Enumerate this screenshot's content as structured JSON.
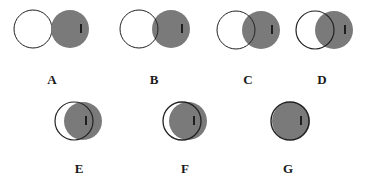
{
  "figure": {
    "panels": [
      {
        "label": "A",
        "white": {
          "cx": 33,
          "cy": 29,
          "r": 19
        },
        "gray": {
          "cx": 70,
          "cy": 29,
          "r": 19
        },
        "mark": {
          "x": 81,
          "y": 29
        },
        "label_pos": {
          "x": 52,
          "y": 84
        }
      },
      {
        "label": "B",
        "white": {
          "cx": 139,
          "cy": 29,
          "r": 19
        },
        "gray": {
          "cx": 171,
          "cy": 29,
          "r": 19
        },
        "mark": {
          "x": 182,
          "y": 29
        },
        "label_pos": {
          "x": 154,
          "y": 84
        }
      },
      {
        "label": "C",
        "white": {
          "cx": 236,
          "cy": 30,
          "r": 19
        },
        "gray": {
          "cx": 261,
          "cy": 30,
          "r": 19
        },
        "mark": {
          "x": 272,
          "y": 30
        },
        "label_pos": {
          "x": 248,
          "y": 84
        }
      },
      {
        "label": "D",
        "white": {
          "cx": 315,
          "cy": 30,
          "r": 19
        },
        "gray": {
          "cx": 334,
          "cy": 30,
          "r": 19
        },
        "mark": {
          "x": 345,
          "y": 30
        },
        "label_pos": {
          "x": 322,
          "y": 84
        }
      },
      {
        "label": "E",
        "white": {
          "cx": 74,
          "cy": 121,
          "r": 19
        },
        "gray": {
          "cx": 83,
          "cy": 121,
          "r": 19
        },
        "mark": {
          "x": 86,
          "y": 121
        },
        "label_pos": {
          "x": 79,
          "y": 173
        }
      },
      {
        "label": "F",
        "white": {
          "cx": 182,
          "cy": 121,
          "r": 19
        },
        "gray": {
          "cx": 188,
          "cy": 121,
          "r": 19
        },
        "mark": {
          "x": 194,
          "y": 121
        },
        "label_pos": {
          "x": 185,
          "y": 173
        }
      },
      {
        "label": "G",
        "white": {
          "cx": 290,
          "cy": 121,
          "r": 19
        },
        "gray": {
          "cx": 291,
          "cy": 121,
          "r": 19
        },
        "mark": {
          "x": 301,
          "y": 121
        },
        "label_pos": {
          "x": 288,
          "y": 173
        }
      }
    ],
    "colors": {
      "gray_fill": "#7a7a7a",
      "outline": "#222222",
      "mark": "#1e1e1e",
      "background": "#ffffff"
    }
  },
  "labels": {
    "A": "A",
    "B": "B",
    "C": "C",
    "D": "D",
    "E": "E",
    "F": "F",
    "G": "G"
  }
}
